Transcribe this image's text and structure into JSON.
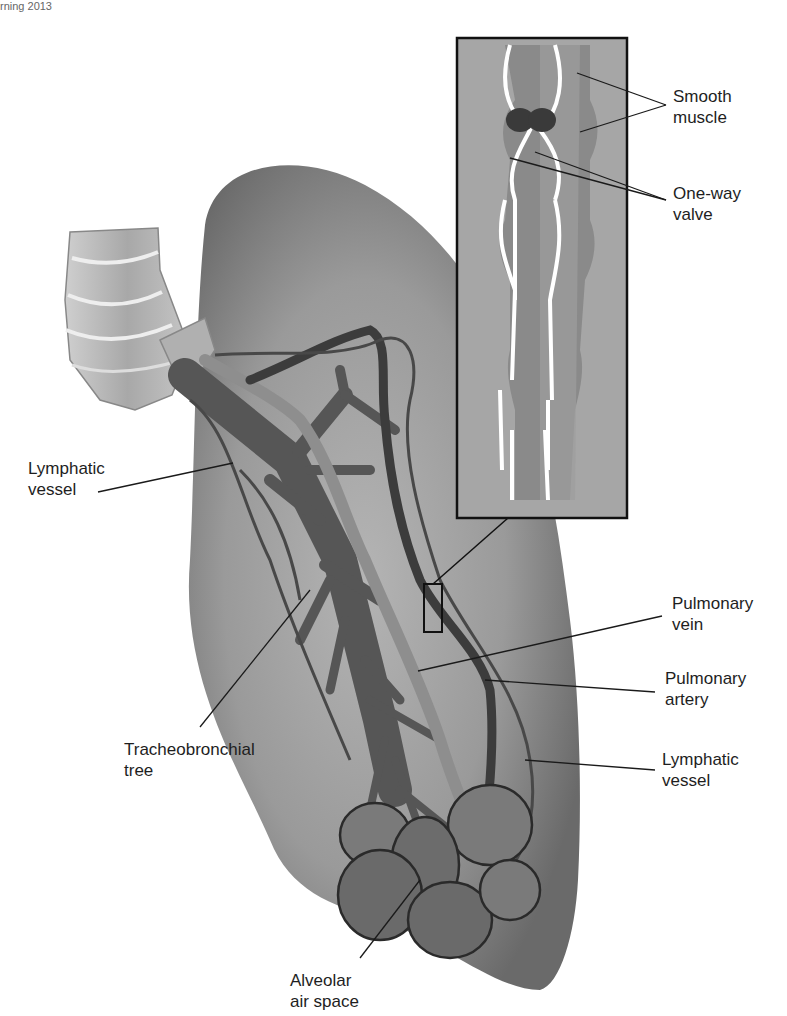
{
  "credit": "rning 2013",
  "inset": {
    "labels": {
      "smooth_muscle": [
        "Smooth",
        "muscle"
      ],
      "one_way_valve": [
        "One-way",
        "valve"
      ]
    }
  },
  "labels": {
    "lymphatic_vessel_left": [
      "Lymphatic",
      "vessel"
    ],
    "pulmonary_vein": [
      "Pulmonary",
      "vein"
    ],
    "pulmonary_artery": [
      "Pulmonary",
      "artery"
    ],
    "lymphatic_vessel_right": [
      "Lymphatic",
      "vessel"
    ],
    "tracheobronchial_tree": [
      "Tracheobronchial",
      "tree"
    ],
    "alveolar_air_space": [
      "Alveolar",
      "air space"
    ]
  },
  "colors": {
    "lung": "#8a8a8a",
    "lung_dark": "#6e6e6e",
    "inset_bg": "#a3a3a3",
    "bronchi": "#5a5a5a",
    "artery": "#8c8c8c",
    "vein": "#3a3a3a",
    "lymph": "#4a4a4a",
    "trachea": "#b8b8b8"
  }
}
